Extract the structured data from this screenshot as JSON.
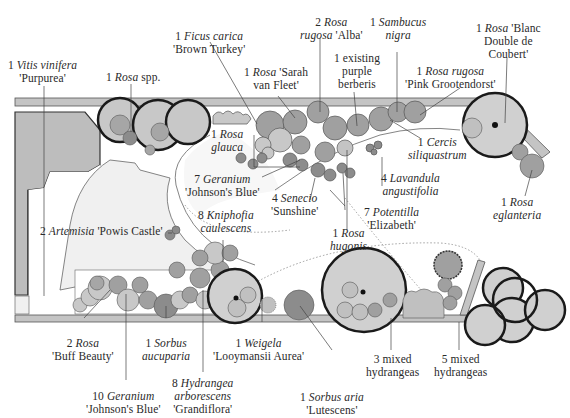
{
  "colors": {
    "background": "#ffffff",
    "paving": "#bdbdbd",
    "lawn": "#f2f2f2",
    "light_plant": "#c8c8c8",
    "mid_plant": "#a6a6a6",
    "dark_plant": "#8c8c8c",
    "outline": "#1a1a1a",
    "leader": "#444444"
  },
  "labels": [
    {
      "id": "vitis",
      "qty": "1",
      "genus": "Vitis vinifera",
      "cultivar": "'Purpurea'"
    },
    {
      "id": "rosa-spp",
      "qty": "1",
      "genus": "Rosa",
      "cultivar": "spp."
    },
    {
      "id": "ficus",
      "qty": "1",
      "genus": "Ficus carica",
      "cultivar": "'Brown Turkey'"
    },
    {
      "id": "rosa-sarah",
      "qty": "1",
      "genus": "Rosa",
      "cultivar": "'Sarah van Fleet'"
    },
    {
      "id": "rosa-rugosa-alba",
      "qty": "2",
      "genus": "Rosa rugosa",
      "cultivar": "'Alba'"
    },
    {
      "id": "berberis",
      "qty": "1",
      "genus": "",
      "cultivar": "existing purple berberis"
    },
    {
      "id": "sambucus",
      "qty": "1",
      "genus": "Sambucus nigra",
      "cultivar": ""
    },
    {
      "id": "rosa-pink",
      "qty": "1",
      "genus": "Rosa rugosa",
      "cultivar": "'Pink Grootendorst'"
    },
    {
      "id": "rosa-blanc",
      "qty": "1",
      "genus": "Rosa",
      "cultivar": "'Blanc Double de Coubert'"
    },
    {
      "id": "rosa-glauca",
      "qty": "1",
      "genus": "Rosa glauca",
      "cultivar": ""
    },
    {
      "id": "cercis",
      "qty": "1",
      "genus": "Cercis siliquastrum",
      "cultivar": ""
    },
    {
      "id": "geranium-7",
      "qty": "7",
      "genus": "Geranium",
      "cultivar": "'Johnson's Blue'"
    },
    {
      "id": "senecio",
      "qty": "4",
      "genus": "Senecio",
      "cultivar": "'Sunshine'"
    },
    {
      "id": "lavandula",
      "qty": "4",
      "genus": "Lavandula angustifolia",
      "cultivar": ""
    },
    {
      "id": "rosa-eglanteria",
      "qty": "1",
      "genus": "Rosa eglanteria",
      "cultivar": ""
    },
    {
      "id": "kniphofia",
      "qty": "8",
      "genus": "Kniphofia caulescens",
      "cultivar": ""
    },
    {
      "id": "potentilla",
      "qty": "7",
      "genus": "Potentilla",
      "cultivar": "'Elizabeth'"
    },
    {
      "id": "artemisia",
      "qty": "2",
      "genus": "Artemisia",
      "cultivar": "'Powis Castle'"
    },
    {
      "id": "rosa-hugonis",
      "qty": "1",
      "genus": "Rosa hugonis",
      "cultivar": ""
    },
    {
      "id": "rosa-buff",
      "qty": "2",
      "genus": "Rosa",
      "cultivar": "'Buff Beauty'"
    },
    {
      "id": "sorbus-auc",
      "qty": "1",
      "genus": "Sorbus aucuparia",
      "cultivar": ""
    },
    {
      "id": "weigela",
      "qty": "1",
      "genus": "Weigela",
      "cultivar": "'Looymansii Aurea'"
    },
    {
      "id": "hydr-3",
      "qty": "3",
      "genus": "",
      "cultivar": "mixed hydrangeas"
    },
    {
      "id": "hydr-5",
      "qty": "5",
      "genus": "",
      "cultivar": "mixed hydrangeas"
    },
    {
      "id": "geranium-10",
      "qty": "10",
      "genus": "Geranium",
      "cultivar": "'Johnson's Blue'"
    },
    {
      "id": "hydrangea-arb",
      "qty": "8",
      "genus": "Hydrangea arborescens",
      "cultivar": "'Grandiflora'"
    },
    {
      "id": "sorbus-aria",
      "qty": "1",
      "genus": "Sorbus aria",
      "cultivar": "'Lutescens'"
    }
  ],
  "text": {
    "vitis_1": "1 ",
    "vitis_2": "Vitis vinifera",
    "vitis_3": "'Purpurea'",
    "rosaspp_1": "1 ",
    "rosaspp_2": "Rosa",
    "rosaspp_3": " spp.",
    "ficus_1": "1 ",
    "ficus_2": "Ficus carica",
    "ficus_3": "'Brown Turkey'",
    "sarah_1": "1 ",
    "sarah_2": "Rosa",
    "sarah_3": " 'Sarah",
    "sarah_4": "van Fleet'",
    "alba_1": "2 ",
    "alba_2": "Rosa",
    "alba_3": "rugosa",
    "alba_4": "  'Alba'",
    "berb_1": "1 existing",
    "berb_2": "purple",
    "berb_3": "berberis",
    "samb_1": "1 ",
    "samb_2": "Sambucus",
    "samb_3": "nigra",
    "pink_1": "1 ",
    "pink_2": "Rosa rugosa",
    "pink_3": "'Pink Grootendorst'",
    "blanc_1": "1 ",
    "blanc_2": "Rosa",
    "blanc_3": " 'Blanc",
    "blanc_4": "Double de",
    "blanc_5": "Coubert'",
    "glauca_1": "1 ",
    "glauca_2": "Rosa",
    "glauca_3": "glauca",
    "cercis_1": "1 ",
    "cercis_2": "Cercis",
    "cercis_3": "siliquastrum",
    "ger7_1": "7 ",
    "ger7_2": "Geranium",
    "ger7_3": "'Johnson's Blue'",
    "sen_1": "4 ",
    "sen_2": "Senecio",
    "sen_3": "'Sunshine'",
    "lav_1": "4 ",
    "lav_2": "Lavandula",
    "lav_3": "angustifolia",
    "egl_1": "1 ",
    "egl_2": "Rosa",
    "egl_3": "eglanteria",
    "knip_1": "8 ",
    "knip_2": "Kniphofia",
    "knip_3": "caulescens",
    "pot_1": "7 ",
    "pot_2": "Potentilla",
    "pot_3": "'Elizabeth'",
    "art_1": "2 ",
    "art_2": "Artemisia",
    "art_3": " 'Powis Castle'",
    "hug_1": "1 ",
    "hug_2": "Rosa",
    "hug_3": "hugonis",
    "buff_1": "2 ",
    "buff_2": "Rosa",
    "buff_3": "'Buff Beauty'",
    "sorb_1": "1 ",
    "sorb_2": "Sorbus",
    "sorb_3": "aucuparia",
    "weig_1": "1 ",
    "weig_2": "Weigela",
    "weig_3": "'Looymansii Aurea'",
    "h3_1": "3 mixed",
    "h3_2": "hydrangeas",
    "h5_1": "5 mixed",
    "h5_2": "hydrangeas",
    "ger10_1": "10 ",
    "ger10_2": "Geranium",
    "ger10_3": "'Johnson's Blue'",
    "harb_1": "8 ",
    "harb_2": "Hydrangea",
    "harb_3": "arborescens",
    "harb_4": "'Grandiflora'",
    "saria_1": "1 ",
    "saria_2": "Sorbus aria",
    "saria_3": "'Lutescens'"
  }
}
